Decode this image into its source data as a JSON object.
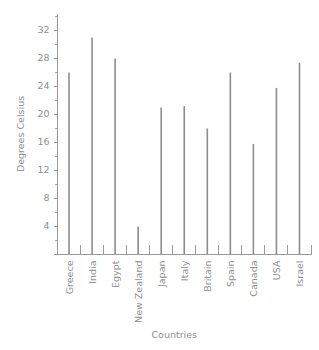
{
  "chart_data": {
    "type": "bar",
    "title": "",
    "xlabel": "Countries",
    "ylabel": "Degrees Celsius",
    "categories": [
      "Greece",
      "India",
      "Egypt",
      "New Zealand",
      "Japan",
      "Italy",
      "Britain",
      "Spain",
      "Canada",
      "USA",
      "Israel"
    ],
    "values": [
      26.0,
      31.0,
      28.0,
      4.0,
      21.0,
      21.2,
      18.0,
      26.0,
      15.8,
      23.8,
      27.4
    ],
    "ylim": [
      0,
      34
    ],
    "ytick_labels": [
      "4",
      "8",
      "12",
      "16",
      "20",
      "24",
      "28",
      "32"
    ],
    "ytick_values": [
      4,
      8,
      12,
      16,
      20,
      24,
      28,
      32
    ],
    "yminor_ticks": [
      2,
      6,
      10,
      14,
      18,
      22,
      26,
      30,
      34
    ],
    "grid": false,
    "legend": false,
    "bar_color": "#8d8d8d",
    "axis_color": "#9a9a9a",
    "text_color": "#8f8f8f"
  }
}
